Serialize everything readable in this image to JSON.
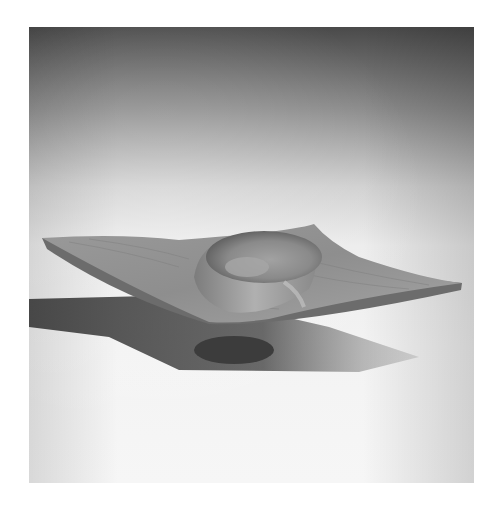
{
  "image": {
    "subject": "wooden-square-bowl",
    "description": "Turned wooden square-winged bowl with central circular well on white studio background with dark gradient top",
    "colors": {
      "background_top": "#4a4a4a",
      "background_bottom": "#f6f6f6",
      "wood_light": "#a8a8a8",
      "wood_mid": "#8c8c8c",
      "wood_dark": "#5a5a5a",
      "shadow": "#3a3a3a"
    }
  }
}
